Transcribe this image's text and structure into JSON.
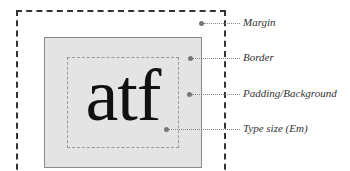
{
  "diagram": {
    "sample_text": "atf",
    "labels": {
      "margin": "Margin",
      "border": "Border",
      "padding": "Padding/Background",
      "type_size": "Type size (Em)"
    },
    "colors": {
      "background_fill": "#e4e4e4",
      "border_line": "#8a8a8a",
      "margin_dash": "#333333",
      "leader": "#888888"
    }
  }
}
